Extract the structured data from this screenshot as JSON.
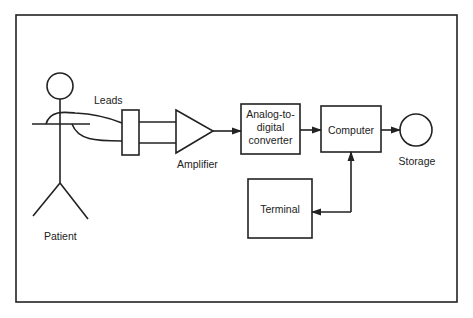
{
  "diagram": {
    "labels": {
      "leads": "Leads",
      "amplifier": "Amplifier",
      "patient": "Patient",
      "adc_line1": "Analog-to-",
      "adc_line2": "digital",
      "adc_line3": "converter",
      "computer": "Computer",
      "storage": "Storage",
      "terminal": "Terminal"
    },
    "colors": {
      "stroke": "#222222",
      "background": "#ffffff"
    }
  }
}
